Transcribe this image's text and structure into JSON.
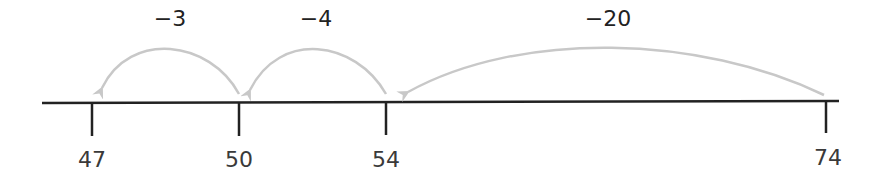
{
  "colors": {
    "axis": "#222222",
    "arc": "#c8c8c8",
    "text": "#3a3a3a"
  },
  "ticks": [
    {
      "value": "47",
      "x": 92
    },
    {
      "value": "50",
      "x": 239
    },
    {
      "value": "54",
      "x": 386
    },
    {
      "value": "74",
      "x": 826
    }
  ],
  "jumps": [
    {
      "label": "−3",
      "from": "50",
      "to": "47"
    },
    {
      "label": "−4",
      "from": "54",
      "to": "50"
    },
    {
      "label": "−20",
      "from": "74",
      "to": "54"
    }
  ]
}
